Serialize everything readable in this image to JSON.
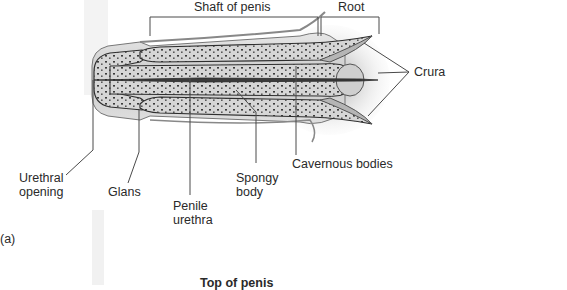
{
  "figure": {
    "panel_label": "(a)",
    "top_labels": {
      "shaft": "Shaft of penis",
      "root": "Root"
    },
    "right_labels": {
      "crura": "Crura"
    },
    "bottom_labels": {
      "urethral_opening": [
        "Urethral",
        "opening"
      ],
      "glans": "Glans",
      "penile_urethra": [
        "Penile",
        "urethra"
      ],
      "spongy_body": [
        "Spongy",
        "body"
      ],
      "cavernous_bodies": "Cavernous bodies"
    },
    "next_panel_heading": "Top of penis",
    "colors": {
      "tissue_light": "#d9d9d9",
      "tissue_mid": "#a8a8a8",
      "tissue_dark": "#3a3a3a",
      "leader_line": "#4a4a4a"
    }
  }
}
